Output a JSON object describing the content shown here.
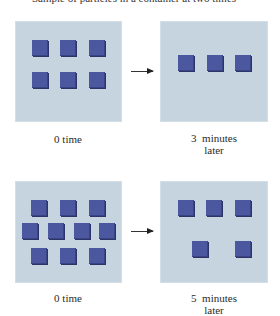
{
  "caption_clipped": "Sample of particles in a container at two times",
  "colors": {
    "panel_bg": "#c5d4df",
    "particle": "#4b579f",
    "particle_shadow": "#2c3468",
    "arrow": "#333333"
  },
  "rows": [
    {
      "before": {
        "label": "0 time",
        "particle_count": 6,
        "arrangement": "2 rows of 3"
      },
      "after": {
        "label_line1": "3  minutes",
        "label_line2": "later",
        "particle_count": 3,
        "arrangement": "1 row of 3"
      }
    },
    {
      "before": {
        "label": "0 time",
        "particle_count": 10,
        "arrangement": "rows of 3, 4, 3"
      },
      "after": {
        "label_line1": "5  minutes",
        "label_line2": "later",
        "particle_count": 5,
        "arrangement": "row of 3, row of 2"
      }
    }
  ]
}
